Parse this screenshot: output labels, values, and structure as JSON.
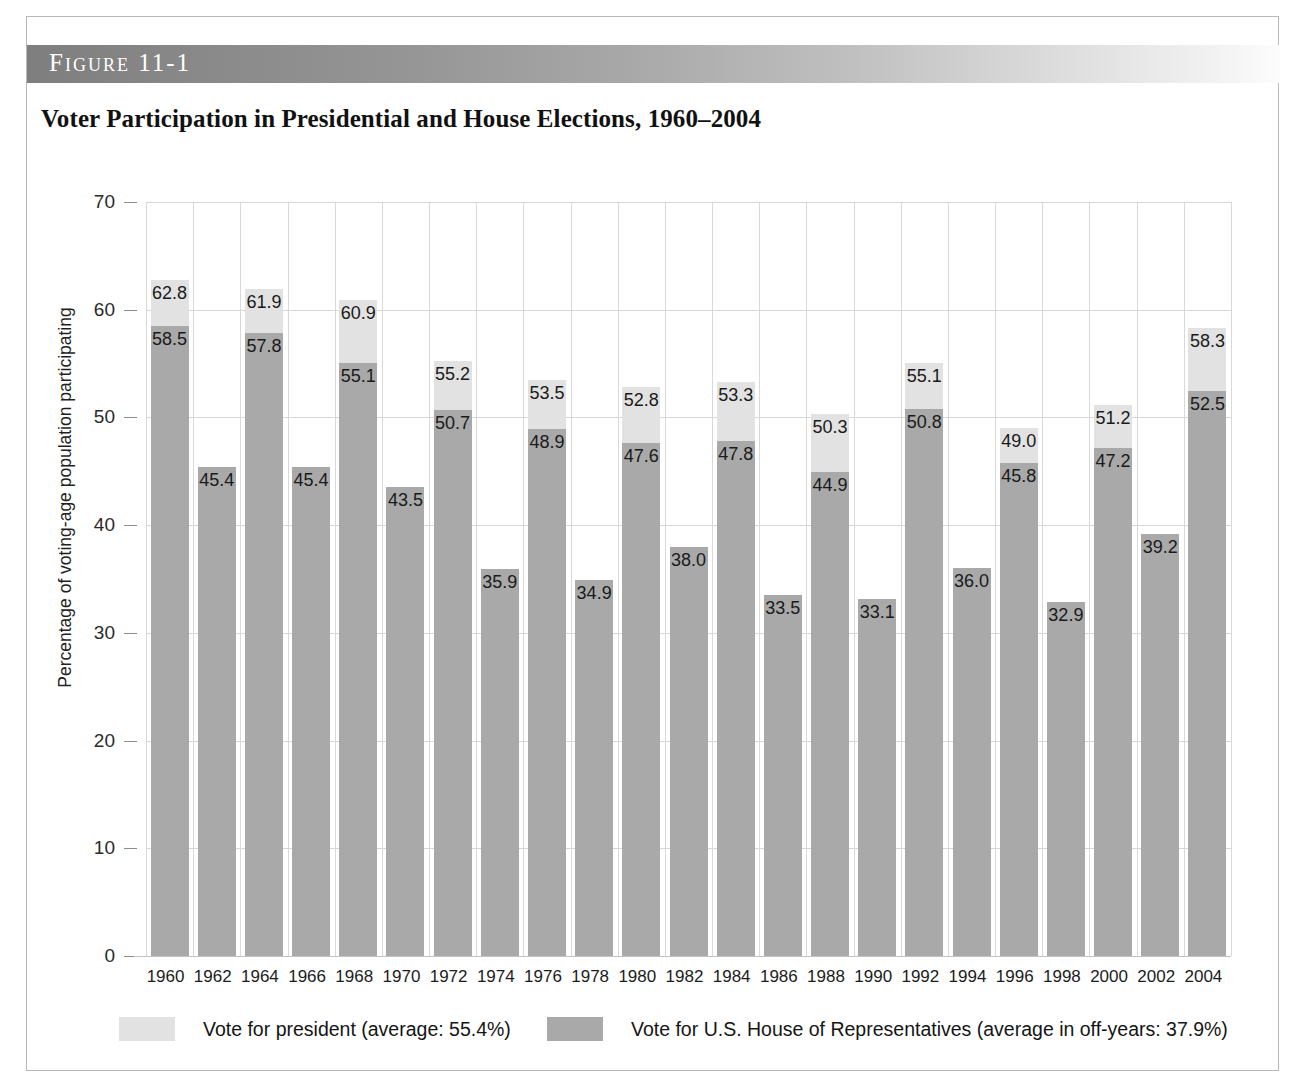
{
  "figure": {
    "banner_label": "Figure 11-1",
    "title": "Voter Participation in Presidential and House Elections, 1960–2004"
  },
  "axes": {
    "ylabel": "Percentage of voting-age population participating",
    "yticks": [
      "0",
      "10",
      "20",
      "30",
      "40",
      "50",
      "60",
      "70"
    ]
  },
  "legend": {
    "president_label": "Vote for president (average: 55.4%)",
    "house_label": "Vote for U.S. House of Representatives (average in off-years: 37.9%)"
  },
  "colors": {
    "president_fill": "#e2e2e2",
    "house_fill": "#a9a9a9",
    "gridline": "#d7d7d7",
    "banner_start": "#7e7e7e",
    "banner_end": "#fdfdfd"
  },
  "chart_data": {
    "type": "bar",
    "title": "Voter Participation in Presidential and House Elections, 1960–2004",
    "xlabel": "",
    "ylabel": "Percentage of voting-age population participating",
    "ylim": [
      0,
      70
    ],
    "ytick_step": 10,
    "grid": true,
    "legend_position": "bottom",
    "stacked": true,
    "categories": [
      "1960",
      "1962",
      "1964",
      "1966",
      "1968",
      "1970",
      "1972",
      "1974",
      "1976",
      "1978",
      "1980",
      "1982",
      "1984",
      "1986",
      "1988",
      "1990",
      "1992",
      "1994",
      "1996",
      "1998",
      "2000",
      "2002",
      "2004"
    ],
    "series": [
      {
        "name": "Vote for president (average: 55.4%)",
        "values": [
          62.8,
          null,
          61.9,
          null,
          60.9,
          null,
          55.2,
          null,
          53.5,
          null,
          52.8,
          null,
          53.3,
          null,
          50.3,
          null,
          55.1,
          null,
          49.0,
          null,
          51.2,
          null,
          58.3
        ]
      },
      {
        "name": "Vote for U.S. House of Representatives (average in off-years: 37.9%)",
        "values": [
          58.5,
          45.4,
          57.8,
          45.4,
          55.1,
          43.5,
          50.7,
          35.9,
          48.9,
          34.9,
          47.6,
          38.0,
          47.8,
          33.5,
          44.9,
          33.1,
          50.8,
          36.0,
          45.8,
          32.9,
          47.2,
          39.2,
          52.5
        ]
      }
    ],
    "averages": {
      "president": 55.4,
      "house_off_years": 37.9
    }
  }
}
